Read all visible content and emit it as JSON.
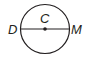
{
  "diagram": {
    "type": "circle-with-diameter",
    "circle": {
      "cx": 45,
      "cy": 29,
      "r": 24.5,
      "stroke": "#231f20"
    },
    "center": {
      "label": "C",
      "x": 45,
      "y": 29
    },
    "diameter": {
      "endpoints": [
        {
          "label": "D",
          "x": 20.5,
          "y": 29
        },
        {
          "label": "M",
          "x": 69.5,
          "y": 29
        }
      ]
    },
    "labels": {
      "center": "C",
      "left_endpoint": "D",
      "right_endpoint": "M"
    }
  }
}
